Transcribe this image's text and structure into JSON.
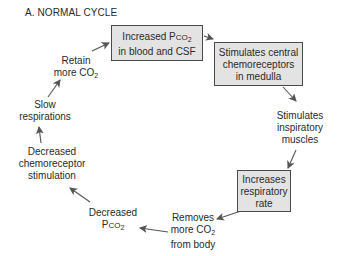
{
  "title": "A. NORMAL CYCLE",
  "nodes": [
    {
      "id": "increased-pco2",
      "boxed": true,
      "line1_pre": "Increased P",
      "line1_sc": "CO",
      "line1_sub": "2",
      "line2": "in blood and CSF"
    },
    {
      "id": "stimulates-central",
      "boxed": true,
      "lines": [
        "Stimulates central",
        "chemoreceptors",
        "in medulla"
      ]
    },
    {
      "id": "stimulates-inspiratory",
      "boxed": false,
      "lines": [
        "Stimulates",
        "inspiratory",
        "muscles"
      ]
    },
    {
      "id": "increases-rate",
      "boxed": true,
      "lines": [
        "Increases",
        "respiratory",
        "rate"
      ]
    },
    {
      "id": "removes-co2",
      "boxed": false,
      "line1": "Removes",
      "line2_pre": "more CO",
      "line2_sub": "2",
      "line3": "from body"
    },
    {
      "id": "decreased-pco2",
      "boxed": false,
      "line1": "Decreased",
      "line2_pre": "P",
      "line2_sc": "CO",
      "line2_sub": "2"
    },
    {
      "id": "decreased-chemo",
      "boxed": false,
      "lines": [
        "Decreased",
        "chemoreceptor",
        "stimulation"
      ]
    },
    {
      "id": "slow-resp",
      "boxed": false,
      "lines": [
        "Slow",
        "respirations"
      ]
    },
    {
      "id": "retain-co2",
      "boxed": false,
      "line1": "Retain",
      "line2_pre": "more CO",
      "line2_sub": "2"
    }
  ],
  "colors": {
    "box_fill": "#e3e3e3",
    "box_border": "#4a4a4a",
    "arrow": "#555555",
    "text": "#2a2a2a"
  }
}
